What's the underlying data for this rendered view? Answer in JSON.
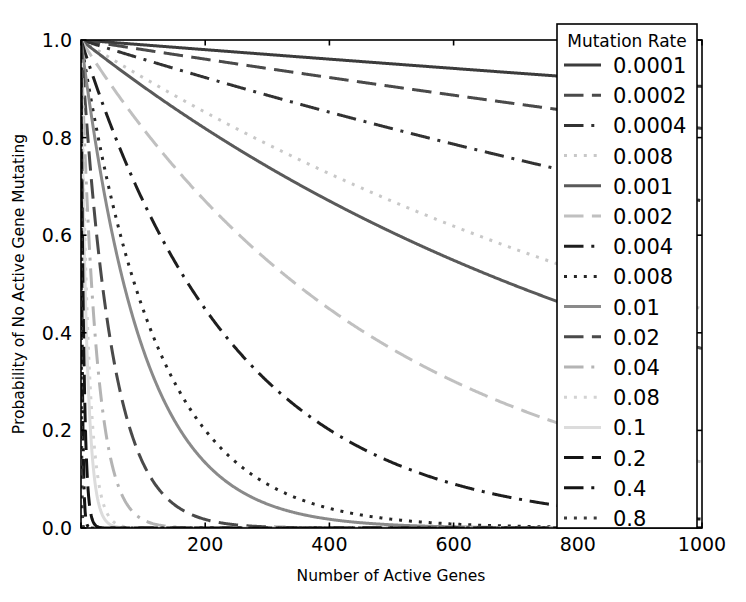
{
  "chart_data": {
    "type": "line",
    "title": "",
    "xlabel": "Number of Active Genes",
    "ylabel": "Probability of No Active Gene Mutating",
    "xlim": [
      0,
      1000
    ],
    "ylim": [
      0.0,
      1.0
    ],
    "xticks": [
      0,
      200,
      400,
      600,
      800,
      1000
    ],
    "xticklabels": [
      "0",
      "200",
      "400",
      "600",
      "800",
      "1000"
    ],
    "yticks": [
      0.0,
      0.2,
      0.4,
      0.6,
      0.8,
      1.0
    ],
    "yticklabels": [
      "0.0",
      "0.2",
      "0.4",
      "0.6",
      "0.8",
      "1.0"
    ],
    "grid": false,
    "legend_position": "right",
    "legend_title": "Mutation Rate",
    "formula": "P(n) = (1 - rate)^n",
    "x": [
      0,
      50,
      100,
      150,
      200,
      250,
      300,
      350,
      400,
      450,
      500,
      550,
      600,
      650,
      700,
      750,
      800,
      850,
      900,
      950,
      1000
    ],
    "series": [
      {
        "name": "0.0001",
        "rate": 0.0001,
        "style": "solid",
        "gray": "#3c3c3c",
        "values": [
          1.0,
          0.995,
          0.99,
          0.985,
          0.98,
          0.975,
          0.97,
          0.966,
          0.961,
          0.956,
          0.951,
          0.946,
          0.942,
          0.937,
          0.932,
          0.928,
          0.923,
          0.919,
          0.914,
          0.909,
          0.905
        ]
      },
      {
        "name": "0.0002",
        "rate": 0.0002,
        "style": "dashed",
        "gray": "#4a4a4a",
        "values": [
          1.0,
          0.99,
          0.98,
          0.97,
          0.961,
          0.951,
          0.942,
          0.932,
          0.923,
          0.914,
          0.905,
          0.895,
          0.887,
          0.878,
          0.869,
          0.861,
          0.852,
          0.844,
          0.835,
          0.827,
          0.819
        ]
      },
      {
        "name": "0.0004",
        "rate": 0.0004,
        "style": "dashdot",
        "gray": "#323232",
        "values": [
          1.0,
          0.98,
          0.961,
          0.942,
          0.923,
          0.905,
          0.887,
          0.869,
          0.852,
          0.835,
          0.819,
          0.803,
          0.787,
          0.771,
          0.756,
          0.741,
          0.726,
          0.712,
          0.698,
          0.684,
          0.67
        ]
      },
      {
        "name": "0.008",
        "rate": 0.0008,
        "style": "dotted",
        "gray": "#c8c8c8",
        "values": [
          1.0,
          0.961,
          0.923,
          0.887,
          0.852,
          0.819,
          0.787,
          0.756,
          0.726,
          0.698,
          0.67,
          0.644,
          0.619,
          0.595,
          0.571,
          0.549,
          0.527,
          0.507,
          0.487,
          0.468,
          0.449
        ]
      },
      {
        "name": "0.001",
        "rate": 0.001,
        "style": "solid",
        "gray": "#5a5a5a",
        "values": [
          1.0,
          0.951,
          0.905,
          0.861,
          0.819,
          0.779,
          0.741,
          0.705,
          0.67,
          0.638,
          0.607,
          0.577,
          0.549,
          0.522,
          0.497,
          0.472,
          0.449,
          0.427,
          0.406,
          0.387,
          0.368
        ]
      },
      {
        "name": "0.002",
        "rate": 0.002,
        "style": "dashed",
        "gray": "#c0c0c0",
        "values": [
          1.0,
          0.905,
          0.819,
          0.741,
          0.67,
          0.607,
          0.549,
          0.497,
          0.449,
          0.406,
          0.368,
          0.333,
          0.301,
          0.272,
          0.246,
          0.223,
          0.201,
          0.182,
          0.165,
          0.149,
          0.135
        ]
      },
      {
        "name": "0.004",
        "rate": 0.004,
        "style": "dashdot",
        "gray": "#1e1e1e",
        "values": [
          1.0,
          0.819,
          0.67,
          0.549,
          0.449,
          0.368,
          0.301,
          0.246,
          0.201,
          0.165,
          0.135,
          0.11,
          0.09,
          0.074,
          0.06,
          0.05,
          0.041,
          0.033,
          0.027,
          0.022,
          0.018
        ]
      },
      {
        "name": "0.008",
        "rate": 0.008,
        "style": "dotted",
        "gray": "#262626",
        "values": [
          1.0,
          0.67,
          0.449,
          0.301,
          0.201,
          0.135,
          0.09,
          0.06,
          0.04,
          0.027,
          0.018,
          0.012,
          0.008,
          0.005,
          0.004,
          0.002,
          0.002,
          0.001,
          0.001,
          0.0,
          0.0
        ]
      },
      {
        "name": "0.01",
        "rate": 0.01,
        "style": "solid",
        "gray": "#8a8a8a",
        "values": [
          1.0,
          0.605,
          0.366,
          0.221,
          0.134,
          0.081,
          0.049,
          0.03,
          0.018,
          0.011,
          0.007,
          0.004,
          0.002,
          0.001,
          0.001,
          0.0,
          0.0,
          0.0,
          0.0,
          0.0,
          0.0
        ]
      },
      {
        "name": "0.02",
        "rate": 0.02,
        "style": "dashed",
        "gray": "#4a4a4a",
        "values": [
          1.0,
          0.364,
          0.133,
          0.048,
          0.018,
          0.006,
          0.002,
          0.001,
          0.0,
          0.0,
          0.0,
          0.0,
          0.0,
          0.0,
          0.0,
          0.0,
          0.0,
          0.0,
          0.0,
          0.0,
          0.0
        ]
      },
      {
        "name": "0.04",
        "rate": 0.04,
        "style": "dashdot",
        "gray": "#b4b4b4",
        "values": [
          1.0,
          0.13,
          0.017,
          0.002,
          0.0,
          0.0,
          0.0,
          0.0,
          0.0,
          0.0,
          0.0,
          0.0,
          0.0,
          0.0,
          0.0,
          0.0,
          0.0,
          0.0,
          0.0,
          0.0,
          0.0
        ]
      },
      {
        "name": "0.08",
        "rate": 0.08,
        "style": "dotted",
        "gray": "#d2d2d2",
        "values": [
          1.0,
          0.015,
          0.0,
          0.0,
          0.0,
          0.0,
          0.0,
          0.0,
          0.0,
          0.0,
          0.0,
          0.0,
          0.0,
          0.0,
          0.0,
          0.0,
          0.0,
          0.0,
          0.0,
          0.0,
          0.0
        ]
      },
      {
        "name": "0.1",
        "rate": 0.1,
        "style": "solid",
        "gray": "#dcdcdc",
        "values": [
          1.0,
          0.005,
          0.0,
          0.0,
          0.0,
          0.0,
          0.0,
          0.0,
          0.0,
          0.0,
          0.0,
          0.0,
          0.0,
          0.0,
          0.0,
          0.0,
          0.0,
          0.0,
          0.0,
          0.0,
          0.0
        ]
      },
      {
        "name": "0.2",
        "rate": 0.2,
        "style": "dashed",
        "gray": "#141414",
        "values": [
          1.0,
          0.0,
          0.0,
          0.0,
          0.0,
          0.0,
          0.0,
          0.0,
          0.0,
          0.0,
          0.0,
          0.0,
          0.0,
          0.0,
          0.0,
          0.0,
          0.0,
          0.0,
          0.0,
          0.0,
          0.0
        ]
      },
      {
        "name": "0.4",
        "rate": 0.4,
        "style": "dashdot",
        "gray": "#141414",
        "values": [
          1.0,
          0.0,
          0.0,
          0.0,
          0.0,
          0.0,
          0.0,
          0.0,
          0.0,
          0.0,
          0.0,
          0.0,
          0.0,
          0.0,
          0.0,
          0.0,
          0.0,
          0.0,
          0.0,
          0.0,
          0.0
        ]
      },
      {
        "name": "0.8",
        "rate": 0.8,
        "style": "dotted",
        "gray": "#3c3c3c",
        "values": [
          1.0,
          0.0,
          0.0,
          0.0,
          0.0,
          0.0,
          0.0,
          0.0,
          0.0,
          0.0,
          0.0,
          0.0,
          0.0,
          0.0,
          0.0,
          0.0,
          0.0,
          0.0,
          0.0,
          0.0,
          0.0
        ]
      }
    ]
  },
  "axes": {
    "xlabel": "Number of Active Genes",
    "ylabel": "Probability of No Active Gene Mutating"
  },
  "legend": {
    "title": "Mutation Rate",
    "entries": [
      {
        "label": "0.0001"
      },
      {
        "label": "0.0002"
      },
      {
        "label": "0.0004"
      },
      {
        "label": "0.008"
      },
      {
        "label": "0.001"
      },
      {
        "label": "0.002"
      },
      {
        "label": "0.004"
      },
      {
        "label": "0.008"
      },
      {
        "label": "0.01"
      },
      {
        "label": "0.02"
      },
      {
        "label": "0.04"
      },
      {
        "label": "0.08"
      },
      {
        "label": "0.1"
      },
      {
        "label": "0.2"
      },
      {
        "label": "0.4"
      },
      {
        "label": "0.8"
      }
    ]
  },
  "colors": {
    "spine": "#000000",
    "background": "#ffffff",
    "text": "#000000"
  }
}
